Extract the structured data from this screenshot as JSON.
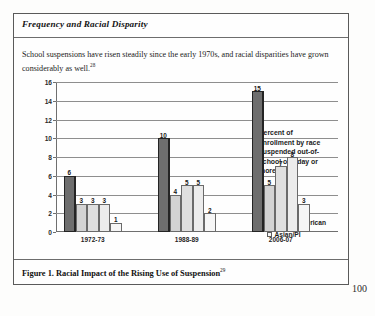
{
  "document": {
    "section_heading": "Frequency and Racial Disparity",
    "body_paragraph": "School suspensions have risen steadily since the early 1970s, and racial disparities have grown considerably as well.",
    "body_footnote_marker": "28",
    "figure_caption": "Figure 1. Racial Impact of the Rising Use of Suspension",
    "caption_footnote_marker": "29",
    "page_number": "100"
  },
  "chart_data": {
    "type": "bar",
    "title": "Racial Impact of the Rising Use of Suspension",
    "xlabel": "",
    "ylabel": "",
    "ylim": [
      0,
      16
    ],
    "yticks": [
      0,
      2,
      4,
      6,
      8,
      10,
      12,
      14,
      16
    ],
    "ytick_labels": [
      "0",
      "2",
      "4",
      "6",
      "8",
      "10",
      "12",
      "14",
      "16"
    ],
    "grid": true,
    "legend_position": "right",
    "legend_title": "Percent of enrollment by race suspended out-of-school one day or more.",
    "categories": [
      "1972-73",
      "1988-89",
      "2006-07"
    ],
    "series": [
      {
        "name": "Blacks",
        "values": [
          6,
          10,
          15
        ]
      },
      {
        "name": "Whites",
        "values": [
          3,
          4,
          5
        ]
      },
      {
        "name": "Hispanic",
        "values": [
          3,
          5,
          7
        ]
      },
      {
        "name": "Native American",
        "values": [
          3,
          5,
          8
        ]
      },
      {
        "name": "Asian/PI",
        "values": [
          1,
          2,
          3
        ]
      }
    ],
    "value_labels": {
      "1972-73": [
        "6",
        "3",
        "3",
        "3",
        "1"
      ],
      "1988-89": [
        "10",
        "4",
        "5",
        "5",
        "2"
      ],
      "2006-07": [
        "15",
        "5",
        "7",
        "8",
        "3"
      ]
    },
    "colors": {
      "Blacks": "#6e6e6e",
      "Whites": "#d3d3d3",
      "Hispanic": "#dfdfdf",
      "Native American": "#ececec",
      "Asian/PI": "#f6f6f6"
    }
  }
}
